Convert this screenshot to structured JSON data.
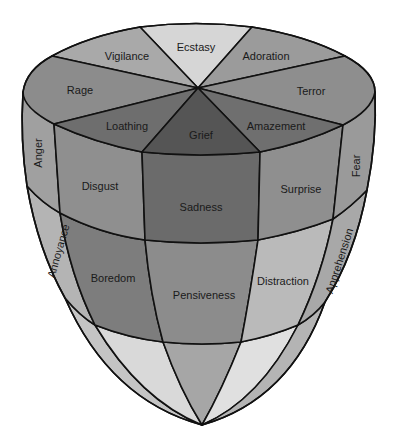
{
  "title": "",
  "colors": {
    "outline": "#111111",
    "top_ecstasy": "#d6d6d6",
    "top_vigilance": "#a9a9a9",
    "top_adoration": "#9b9b9b",
    "top_rage": "#8c8c8c",
    "top_terror": "#8e8e8e",
    "top_loathing": "#6e6e6e",
    "top_amazement": "#6f6f6f",
    "top_grief": "#555555",
    "band1_side": "#a0a0a0",
    "band1_disgust": "#8f8f8f",
    "band1_sadness": "#6b6b6b",
    "band1_surprise": "#8f8f8f",
    "band2_side": "#b4b4b4",
    "band2_boredom": "#7d7d7d",
    "band2_pensiveness": "#8c8c8c",
    "band2_distraction": "#b9b9b9",
    "band3_light": "#d9d9d9",
    "band3_mid": "#a6a6a6",
    "band3_outer": "#c4c4c4"
  },
  "top_ring": {
    "ecstasy": "Ecstasy",
    "vigilance": "Vigilance",
    "adoration": "Adoration",
    "rage": "Rage",
    "terror": "Terror",
    "loathing": "Loathing",
    "amazement": "Amazement",
    "grief": "Grief"
  },
  "middle_band": {
    "anger": "Anger",
    "disgust": "Disgust",
    "sadness": "Sadness",
    "surprise": "Surprise",
    "fear": "Fear"
  },
  "lower_band": {
    "annoyance": "Annoyance",
    "boredom": "Boredom",
    "pensiveness": "Pensiveness",
    "distraction": "Distraction",
    "apprehension": "Apprehension"
  }
}
